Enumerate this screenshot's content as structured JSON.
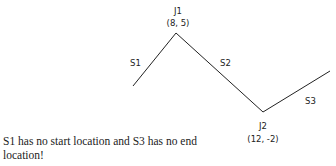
{
  "diagram": {
    "segments": [
      {
        "id": "S1",
        "label": "S1"
      },
      {
        "id": "S2",
        "label": "S2"
      },
      {
        "id": "S3",
        "label": "S3"
      }
    ],
    "joints": [
      {
        "id": "J1",
        "label": "J1",
        "coords": "(8, 5)"
      },
      {
        "id": "J2",
        "label": "J2",
        "coords": "(12, -2)"
      }
    ],
    "line_color": "#222222"
  },
  "caption": "S1 has no start location and S3 has no end location!"
}
